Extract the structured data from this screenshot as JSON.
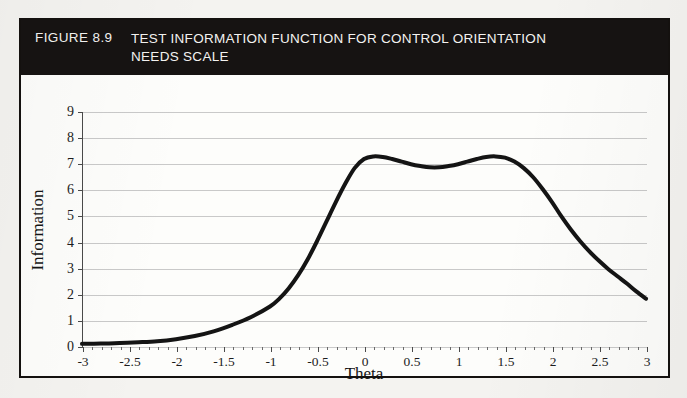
{
  "figure": {
    "number": "FIGURE 8.9",
    "title_lines": [
      "TEST INFORMATION FUNCTION FOR CONTROL ORIENTATION",
      "NEEDS SCALE"
    ],
    "banner_color": "#161312",
    "banner_text_color": "#f3f2f0",
    "frame_color": "#14110f",
    "background_color": "#fdfdfb"
  },
  "chart_data": {
    "type": "line",
    "title": "TEST INFORMATION FUNCTION FOR CONTROL ORIENTATION NEEDS SCALE",
    "subtitle": "",
    "xlabel": "Theta",
    "ylabel": "Information",
    "xlim": [
      -3,
      3
    ],
    "ylim": [
      0,
      9
    ],
    "grid": true,
    "grid_axis": "y",
    "legend": "none",
    "line_color": "#141414",
    "line_width": 4,
    "x_tick_labels": [
      "-3",
      "-2.5",
      "-2",
      "-1.5",
      "-1",
      "-0.5",
      "0",
      "0.5",
      "1",
      "1.5",
      "2",
      "2.5",
      "3"
    ],
    "x_tick_values": [
      -3,
      -2.5,
      -2,
      -1.5,
      -1,
      -0.5,
      0,
      0.5,
      1,
      1.5,
      2,
      2.5,
      3
    ],
    "x_minor_tick_step": 0.1,
    "y_tick_labels": [
      "0",
      "1",
      "2",
      "3",
      "4",
      "5",
      "6",
      "7",
      "8",
      "9"
    ],
    "y_tick_values": [
      0,
      1,
      2,
      3,
      4,
      5,
      6,
      7,
      8,
      9
    ],
    "series": [
      {
        "name": "Test Information",
        "x": [
          -3.0,
          -2.8,
          -2.6,
          -2.4,
          -2.2,
          -2.0,
          -1.8,
          -1.6,
          -1.4,
          -1.2,
          -1.0,
          -0.9,
          -0.8,
          -0.7,
          -0.6,
          -0.5,
          -0.4,
          -0.3,
          -0.2,
          -0.1,
          0.0,
          0.1,
          0.2,
          0.3,
          0.4,
          0.5,
          0.6,
          0.7,
          0.8,
          0.9,
          1.0,
          1.1,
          1.2,
          1.3,
          1.4,
          1.5,
          1.6,
          1.7,
          1.8,
          1.9,
          2.0,
          2.1,
          2.2,
          2.3,
          2.4,
          2.5,
          2.6,
          2.7,
          2.8,
          2.9,
          3.0
        ],
        "y": [
          0.12,
          0.13,
          0.15,
          0.18,
          0.22,
          0.3,
          0.42,
          0.6,
          0.85,
          1.15,
          1.55,
          1.85,
          2.25,
          2.75,
          3.35,
          4.05,
          4.8,
          5.55,
          6.25,
          6.85,
          7.2,
          7.3,
          7.28,
          7.2,
          7.1,
          7.0,
          6.93,
          6.88,
          6.88,
          6.93,
          7.0,
          7.1,
          7.2,
          7.28,
          7.3,
          7.25,
          7.1,
          6.85,
          6.5,
          6.05,
          5.55,
          5.0,
          4.5,
          4.05,
          3.65,
          3.3,
          2.98,
          2.7,
          2.42,
          2.12,
          1.85
        ]
      }
    ],
    "annotations": []
  }
}
